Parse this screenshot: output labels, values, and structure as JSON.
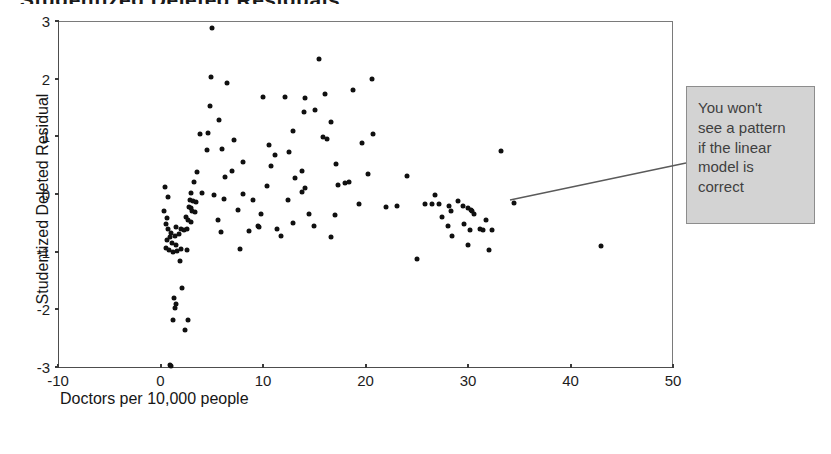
{
  "title_sliver": "Studentized Deleted Residuals",
  "annotation": {
    "text": "You won't\nsee a pattern\nif the linear\nmodel is\ncorrect",
    "background_color": "#d3d3d3",
    "border_color": "#8d8d8d",
    "leader_from": [
      510,
      200
    ],
    "leader_to": [
      686,
      163
    ]
  },
  "chart_data": {
    "type": "scatter",
    "title": "",
    "xlabel": "Doctors per 10,000 people",
    "ylabel": "Studentized Deleted Residual",
    "xlim": [
      -10,
      50
    ],
    "ylim": [
      -3,
      3
    ],
    "xticks": [
      -10,
      0,
      10,
      20,
      30,
      40,
      50
    ],
    "yticks": [
      3,
      2,
      1,
      0,
      -1,
      -2,
      -3
    ],
    "xtick_labels": [
      "-10",
      "0",
      "10",
      "20",
      "30",
      "40",
      "50"
    ],
    "ytick_labels": [
      "3",
      "2",
      "1",
      "0",
      "-1",
      "-2",
      "-3"
    ],
    "grid": false,
    "legend": false,
    "marker": "diamond",
    "marker_color": "#101010",
    "points": [
      [
        5.0,
        2.88
      ],
      [
        4.9,
        2.03
      ],
      [
        15.5,
        2.34
      ],
      [
        6.5,
        1.92
      ],
      [
        20.6,
        2.0
      ],
      [
        4.8,
        1.53
      ],
      [
        10.0,
        1.69
      ],
      [
        12.1,
        1.69
      ],
      [
        14.1,
        1.66
      ],
      [
        16.0,
        1.73
      ],
      [
        18.8,
        1.81
      ],
      [
        5.7,
        1.28
      ],
      [
        16.6,
        1.25
      ],
      [
        15.1,
        1.45
      ],
      [
        14.0,
        1.42
      ],
      [
        3.9,
        1.04
      ],
      [
        4.6,
        1.06
      ],
      [
        12.9,
        1.1
      ],
      [
        20.7,
        1.04
      ],
      [
        4.5,
        0.76
      ],
      [
        6.0,
        0.78
      ],
      [
        7.2,
        0.94
      ],
      [
        10.6,
        0.85
      ],
      [
        15.9,
        0.98
      ],
      [
        16.2,
        0.96
      ],
      [
        19.7,
        0.89
      ],
      [
        12.5,
        0.73
      ],
      [
        11.2,
        0.68
      ],
      [
        3.6,
        0.38
      ],
      [
        7.0,
        0.4
      ],
      [
        8.0,
        0.55
      ],
      [
        10.8,
        0.48
      ],
      [
        13.8,
        0.4
      ],
      [
        17.1,
        0.52
      ],
      [
        20.2,
        0.34
      ],
      [
        24.0,
        0.31
      ],
      [
        3.3,
        0.2
      ],
      [
        6.3,
        0.29
      ],
      [
        3.0,
        0.02
      ],
      [
        4.0,
        0.02
      ],
      [
        5.2,
        -0.01
      ],
      [
        8.0,
        0.0
      ],
      [
        13.8,
        0.03
      ],
      [
        14.1,
        0.1
      ],
      [
        17.3,
        0.16
      ],
      [
        18.0,
        0.19
      ],
      [
        18.4,
        0.2
      ],
      [
        2.9,
        -0.1
      ],
      [
        3.2,
        -0.12
      ],
      [
        3.5,
        -0.14
      ],
      [
        6.2,
        -0.09
      ],
      [
        9.0,
        -0.1
      ],
      [
        12.4,
        -0.1
      ],
      [
        19.4,
        -0.18
      ],
      [
        23.1,
        -0.2
      ],
      [
        25.8,
        -0.18
      ],
      [
        26.5,
        -0.18
      ],
      [
        28.1,
        -0.2
      ],
      [
        2.8,
        -0.22
      ],
      [
        3.0,
        -0.25
      ],
      [
        3.1,
        -0.3
      ],
      [
        3.4,
        -0.32
      ],
      [
        7.6,
        -0.28
      ],
      [
        9.8,
        -0.35
      ],
      [
        14.5,
        -0.34
      ],
      [
        17.0,
        -0.37
      ],
      [
        2.5,
        -0.4
      ],
      [
        2.7,
        -0.45
      ],
      [
        3.0,
        -0.48
      ],
      [
        5.6,
        -0.45
      ],
      [
        9.5,
        -0.55
      ],
      [
        12.9,
        -0.5
      ],
      [
        1.5,
        -0.58
      ],
      [
        2.0,
        -0.6
      ],
      [
        2.3,
        -0.62
      ],
      [
        2.6,
        -0.6
      ],
      [
        9.6,
        -0.58
      ],
      [
        15.0,
        -0.55
      ],
      [
        1.0,
        -0.68
      ],
      [
        1.4,
        -0.72
      ],
      [
        1.8,
        -0.7
      ],
      [
        11.8,
        -0.72
      ],
      [
        16.6,
        -0.75
      ],
      [
        0.6,
        -0.8
      ],
      [
        1.1,
        -0.85
      ],
      [
        1.5,
        -0.88
      ],
      [
        0.5,
        -0.93
      ],
      [
        0.8,
        -0.97
      ],
      [
        1.2,
        -1.0
      ],
      [
        1.6,
        -0.98
      ],
      [
        2.0,
        -0.96
      ],
      [
        2.6,
        -0.97
      ],
      [
        0.9,
        -0.75
      ],
      [
        1.9,
        -1.17
      ],
      [
        25.0,
        -1.13
      ],
      [
        2.1,
        -1.63
      ],
      [
        1.3,
        -1.8
      ],
      [
        1.5,
        -1.9
      ],
      [
        1.4,
        -1.98
      ],
      [
        1.2,
        -2.18
      ],
      [
        2.7,
        -2.19
      ],
      [
        2.4,
        -2.35
      ],
      [
        0.9,
        -2.97
      ],
      [
        1.0,
        -2.99
      ],
      [
        27.5,
        -0.4
      ],
      [
        28.3,
        -0.3
      ],
      [
        29.0,
        -0.12
      ],
      [
        29.5,
        -0.2
      ],
      [
        30.0,
        -0.25
      ],
      [
        30.3,
        -0.27
      ],
      [
        30.4,
        -0.3
      ],
      [
        30.6,
        -0.35
      ],
      [
        29.6,
        -0.52
      ],
      [
        28.0,
        -0.55
      ],
      [
        28.4,
        -0.72
      ],
      [
        30.2,
        -0.62
      ],
      [
        31.2,
        -0.6
      ],
      [
        31.5,
        -0.62
      ],
      [
        31.8,
        -0.45
      ],
      [
        32.3,
        -0.62
      ],
      [
        30.0,
        -0.88
      ],
      [
        32.0,
        -0.97
      ],
      [
        33.2,
        0.74
      ],
      [
        34.5,
        -0.16
      ],
      [
        43.0,
        -0.91
      ],
      [
        26.8,
        -0.02
      ],
      [
        27.2,
        -0.18
      ],
      [
        10.4,
        0.14
      ],
      [
        11.4,
        -0.6
      ],
      [
        13.1,
        0.27
      ],
      [
        8.6,
        -0.65
      ],
      [
        7.8,
        -0.95
      ],
      [
        5.9,
        -0.66
      ],
      [
        22.0,
        -0.22
      ],
      [
        0.4,
        0.12
      ],
      [
        0.7,
        -0.05
      ],
      [
        0.3,
        -0.3
      ],
      [
        0.6,
        -0.42
      ],
      [
        0.5,
        -0.52
      ],
      [
        0.7,
        -0.6
      ]
    ]
  }
}
